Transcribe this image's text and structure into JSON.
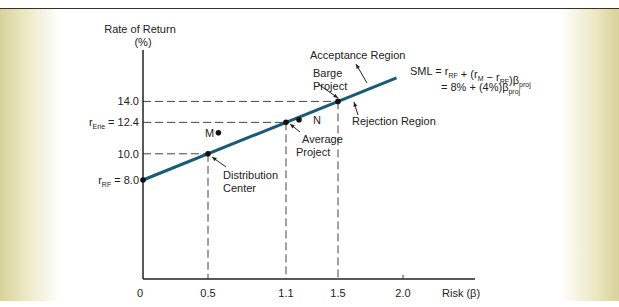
{
  "chart_data": {
    "type": "line",
    "title": "",
    "ylabel": "Rate of Return (%)",
    "xlabel": "Risk (β)",
    "xlim": [
      0,
      2.2
    ],
    "ylim": [
      0,
      16
    ],
    "x_ticks": [
      "0",
      "0.5",
      "1.1",
      "1.5",
      "2.0"
    ],
    "x_tick_values": [
      0,
      0.5,
      1.1,
      1.5,
      2.0
    ],
    "y_ticks": [
      {
        "value": 14.0,
        "label": "14.0"
      },
      {
        "value": 12.4,
        "label": "r_Erie = 12.4",
        "main": "r",
        "sub": "Erie",
        "rest": " = 12.4"
      },
      {
        "value": 10.0,
        "label": "10.0"
      },
      {
        "value": 8.0,
        "label": "r_RF = 8.0",
        "main": "r",
        "sub": "RF",
        "rest": " = 8.0"
      }
    ],
    "series": [
      {
        "name": "SML",
        "x": [
          0,
          1.95
        ],
        "y": [
          8.0,
          15.8
        ],
        "color": "#1a5a78"
      }
    ],
    "points": [
      {
        "name": "Distribution Center",
        "x": 0.5,
        "y": 10.0,
        "on_line": true
      },
      {
        "name": "Average Project",
        "x": 1.1,
        "y": 12.4,
        "on_line": true
      },
      {
        "name": "Barge Project",
        "x": 1.5,
        "y": 14.0,
        "on_line": true
      },
      {
        "name": "M",
        "x": 0.58,
        "y": 11.6,
        "on_line": false
      },
      {
        "name": "N",
        "x": 1.2,
        "y": 12.6,
        "on_line": false
      }
    ],
    "annotations": {
      "acceptance": "Acceptance Region",
      "rejection": "Rejection Region",
      "barge": [
        "Barge",
        "Project"
      ],
      "average": [
        "Average",
        "Project"
      ],
      "distribution": [
        "Distribution",
        "Center"
      ],
      "m": "M",
      "n": "N",
      "sml_line1": "SML = r_RF + (r_M − r_RF)β_proj",
      "sml_line2": "= 8% + (4%)β_proj"
    }
  }
}
